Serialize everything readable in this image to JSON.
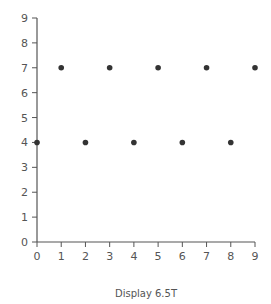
{
  "chart_data": {
    "type": "scatter",
    "title": "",
    "xlabel": "Display 6.5T",
    "ylabel": "",
    "xlim": [
      0,
      9
    ],
    "ylim": [
      0,
      9
    ],
    "x_ticks": [
      0,
      1,
      2,
      3,
      4,
      5,
      6,
      7,
      8,
      9
    ],
    "y_ticks": [
      0,
      1,
      2,
      3,
      4,
      5,
      6,
      7,
      8,
      9
    ],
    "grid": false,
    "legend": null,
    "series": [
      {
        "name": "points",
        "color": "#333333",
        "x": [
          0,
          1,
          2,
          3,
          4,
          5,
          6,
          7,
          8,
          9
        ],
        "y": [
          4,
          7,
          4,
          7,
          4,
          7,
          4,
          7,
          4,
          7
        ]
      }
    ]
  }
}
